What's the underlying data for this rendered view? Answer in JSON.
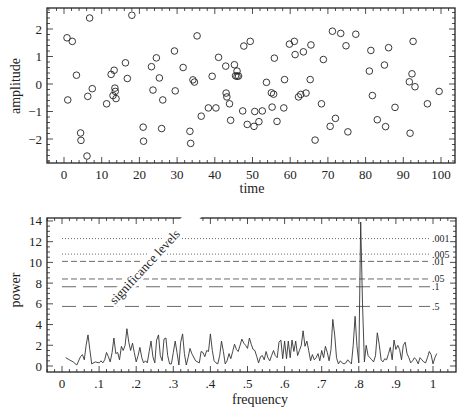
{
  "chart_data": [
    {
      "type": "scatter",
      "title": "",
      "xlabel": "time",
      "ylabel": "amplitude",
      "xlim": [
        -4,
        104
      ],
      "ylim": [
        -2.85,
        2.85
      ],
      "xticks": [
        0,
        10,
        20,
        30,
        40,
        50,
        60,
        70,
        80,
        90,
        100
      ],
      "xtick_labels": [
        "0",
        "10",
        "20",
        "30",
        "40",
        "50",
        "60",
        "70",
        "80",
        "90",
        "100"
      ],
      "yticks": [
        -2,
        -1,
        0,
        1,
        2
      ],
      "ytick_labels": [
        "−2",
        "−1",
        "0",
        "1",
        "2"
      ],
      "grid": false,
      "marker": "open-circle",
      "points": [
        [
          0.8,
          1.68
        ],
        [
          1.0,
          -0.58
        ],
        [
          2.2,
          1.55
        ],
        [
          3.3,
          0.32
        ],
        [
          4.4,
          -1.78
        ],
        [
          4.5,
          -2.05
        ],
        [
          6.1,
          -2.62
        ],
        [
          6.3,
          -0.45
        ],
        [
          6.8,
          2.4
        ],
        [
          7.5,
          -0.17
        ],
        [
          11.3,
          -0.72
        ],
        [
          12.5,
          0.35
        ],
        [
          13.0,
          -0.42
        ],
        [
          13.3,
          0.5
        ],
        [
          13.5,
          -0.15
        ],
        [
          13.6,
          -0.27
        ],
        [
          13.8,
          -0.53
        ],
        [
          16.3,
          0.77
        ],
        [
          16.8,
          0.2
        ],
        [
          18.0,
          2.5
        ],
        [
          21.0,
          -1.57
        ],
        [
          21.1,
          -2.08
        ],
        [
          23.2,
          0.63
        ],
        [
          23.6,
          -0.22
        ],
        [
          24.5,
          0.95
        ],
        [
          25.3,
          0.22
        ],
        [
          25.9,
          -1.62
        ],
        [
          26.2,
          -0.58
        ],
        [
          29.3,
          1.2
        ],
        [
          29.5,
          -0.25
        ],
        [
          31.6,
          0.6
        ],
        [
          33.4,
          -1.72
        ],
        [
          33.6,
          -2.16
        ],
        [
          34.2,
          0.15
        ],
        [
          34.6,
          0.07
        ],
        [
          35.3,
          1.75
        ],
        [
          36.4,
          -1.17
        ],
        [
          38.3,
          -0.87
        ],
        [
          39.3,
          0.28
        ],
        [
          40.3,
          -0.87
        ],
        [
          41.0,
          0.97
        ],
        [
          42.9,
          0.65
        ],
        [
          43.0,
          -0.33
        ],
        [
          43.2,
          -0.47
        ],
        [
          43.9,
          -0.72
        ],
        [
          44.2,
          -1.32
        ],
        [
          45.2,
          0.7
        ],
        [
          45.5,
          0.3
        ],
        [
          45.9,
          0.47
        ],
        [
          45.9,
          0.28
        ],
        [
          46.3,
          0.29
        ],
        [
          47.4,
          -0.98
        ],
        [
          47.7,
          1.38
        ],
        [
          48.6,
          -1.47
        ],
        [
          49.4,
          1.55
        ],
        [
          50.4,
          -1.54
        ],
        [
          50.6,
          -1.0
        ],
        [
          51.7,
          -1.37
        ],
        [
          52.6,
          -0.98
        ],
        [
          53.7,
          0.06
        ],
        [
          55.0,
          -0.32
        ],
        [
          55.2,
          -0.84
        ],
        [
          55.6,
          -0.37
        ],
        [
          55.8,
          0.94
        ],
        [
          56.5,
          -1.36
        ],
        [
          58.3,
          -0.87
        ],
        [
          58.5,
          0.16
        ],
        [
          59.8,
          1.45
        ],
        [
          61.1,
          1.55
        ],
        [
          61.3,
          1.07
        ],
        [
          62.2,
          -0.47
        ],
        [
          62.8,
          -0.38
        ],
        [
          63.5,
          1.17
        ],
        [
          64.2,
          -0.33
        ],
        [
          65.3,
          0.16
        ],
        [
          65.5,
          1.42
        ],
        [
          66.6,
          -2.04
        ],
        [
          68.3,
          -0.72
        ],
        [
          68.8,
          0.89
        ],
        [
          70.6,
          -1.54
        ],
        [
          71.2,
          1.92
        ],
        [
          72.0,
          -1.25
        ],
        [
          73.4,
          1.84
        ],
        [
          74.8,
          1.39
        ],
        [
          75.3,
          -1.74
        ],
        [
          77.4,
          1.81
        ],
        [
          81.0,
          0.47
        ],
        [
          81.4,
          1.22
        ],
        [
          81.8,
          -0.42
        ],
        [
          83.1,
          -1.3
        ],
        [
          85.0,
          0.69
        ],
        [
          85.3,
          -1.55
        ],
        [
          86.1,
          1.32
        ],
        [
          87.8,
          -0.85
        ],
        [
          91.6,
          0.08
        ],
        [
          91.8,
          -1.79
        ],
        [
          92.3,
          0.37
        ],
        [
          92.6,
          1.55
        ],
        [
          93.1,
          -0.1
        ],
        [
          96.4,
          -0.72
        ],
        [
          99.5,
          -0.27
        ]
      ]
    },
    {
      "type": "line",
      "title": "",
      "xlabel": "frequency",
      "ylabel": "power",
      "xlim": [
        -0.04,
        1.06
      ],
      "ylim": [
        -0.2,
        14.4
      ],
      "xticks": [
        0,
        0.1,
        0.2,
        0.3,
        0.4,
        0.5,
        0.6,
        0.7,
        0.8,
        0.9,
        1
      ],
      "xtick_labels": [
        "0",
        ".1",
        ".2",
        ".3",
        ".4",
        ".5",
        ".6",
        ".7",
        ".8",
        ".9",
        "1"
      ],
      "yticks": [
        0,
        2,
        4,
        6,
        8,
        10,
        12,
        14
      ],
      "ytick_labels": [
        "0",
        "2",
        "4",
        "6",
        "8",
        "10",
        "12",
        "14"
      ],
      "grid": false,
      "annotation": "significance levels",
      "significance_levels": [
        {
          "label": ".001",
          "power": 12.3,
          "style": "dotted"
        },
        {
          "label": ".005",
          "power": 10.8,
          "style": "dotted"
        },
        {
          "label": ".01",
          "power": 10.1,
          "style": "short-dash"
        },
        {
          "label": ".05",
          "power": 8.4,
          "style": "short-dash"
        },
        {
          "label": ".1",
          "power": 7.65,
          "style": "long-dash"
        },
        {
          "label": ".5",
          "power": 5.75,
          "style": "long-dash"
        }
      ],
      "series": [
        {
          "name": "power spectrum",
          "x": [
            0.01,
            0.02,
            0.03,
            0.04,
            0.05,
            0.055,
            0.06,
            0.065,
            0.07,
            0.075,
            0.08,
            0.09,
            0.1,
            0.105,
            0.11,
            0.115,
            0.12,
            0.125,
            0.13,
            0.135,
            0.14,
            0.145,
            0.15,
            0.155,
            0.16,
            0.165,
            0.17,
            0.175,
            0.18,
            0.185,
            0.19,
            0.195,
            0.2,
            0.205,
            0.21,
            0.215,
            0.22,
            0.225,
            0.23,
            0.235,
            0.24,
            0.245,
            0.25,
            0.255,
            0.26,
            0.265,
            0.27,
            0.275,
            0.28,
            0.285,
            0.29,
            0.295,
            0.3,
            0.305,
            0.31,
            0.315,
            0.32,
            0.325,
            0.33,
            0.335,
            0.34,
            0.345,
            0.35,
            0.36,
            0.37,
            0.375,
            0.38,
            0.385,
            0.39,
            0.395,
            0.4,
            0.405,
            0.41,
            0.415,
            0.42,
            0.425,
            0.43,
            0.435,
            0.44,
            0.445,
            0.45,
            0.455,
            0.46,
            0.465,
            0.47,
            0.475,
            0.48,
            0.485,
            0.49,
            0.495,
            0.5,
            0.505,
            0.51,
            0.515,
            0.52,
            0.525,
            0.53,
            0.535,
            0.54,
            0.545,
            0.55,
            0.555,
            0.56,
            0.565,
            0.57,
            0.575,
            0.58,
            0.585,
            0.59,
            0.595,
            0.6,
            0.605,
            0.61,
            0.615,
            0.62,
            0.625,
            0.63,
            0.635,
            0.64,
            0.645,
            0.65,
            0.655,
            0.66,
            0.665,
            0.67,
            0.675,
            0.68,
            0.685,
            0.69,
            0.695,
            0.7,
            0.705,
            0.71,
            0.715,
            0.72,
            0.725,
            0.73,
            0.735,
            0.74,
            0.745,
            0.75,
            0.755,
            0.76,
            0.765,
            0.77,
            0.775,
            0.78,
            0.785,
            0.79,
            0.795,
            0.8,
            0.805,
            0.81,
            0.815,
            0.82,
            0.825,
            0.83,
            0.835,
            0.84,
            0.845,
            0.85,
            0.855,
            0.86,
            0.865,
            0.87,
            0.875,
            0.88,
            0.885,
            0.89,
            0.895,
            0.9,
            0.905,
            0.91,
            0.915,
            0.92,
            0.925,
            0.93,
            0.935,
            0.94,
            0.945,
            0.95,
            0.955,
            0.96,
            0.965,
            0.97,
            0.975,
            0.98,
            0.985,
            0.99,
            0.995,
            1.0,
            1.005,
            1.01
          ],
          "y": [
            0.8,
            0.6,
            0.4,
            0.1,
            0.9,
            1.1,
            0.6,
            2.0,
            3.0,
            1.6,
            0.2,
            0.4,
            0.3,
            0.5,
            0.3,
            0.6,
            1.3,
            0.9,
            0.4,
            1.3,
            2.7,
            1.2,
            1.3,
            0.6,
            1.9,
            1.5,
            2.0,
            3.6,
            2.3,
            1.5,
            2.2,
            1.3,
            0.4,
            1.0,
            1.8,
            0.8,
            0.3,
            0.5,
            0.3,
            1.4,
            2.4,
            0.9,
            0.3,
            2.5,
            3.0,
            1.0,
            0.5,
            2.6,
            2.7,
            1.0,
            0.2,
            0.2,
            1.3,
            2.4,
            1.3,
            0.1,
            2.3,
            3.1,
            1.2,
            0.1,
            0.8,
            1.7,
            1.2,
            0.5,
            0.3,
            1.4,
            1.3,
            0.9,
            1.5,
            1.4,
            3.1,
            1.5,
            0.5,
            0.3,
            0.2,
            1.0,
            2.4,
            1.4,
            0.2,
            0.5,
            1.2,
            0.7,
            1.4,
            2.1,
            1.6,
            1.4,
            2.0,
            2.6,
            2.2,
            2.0,
            1.7,
            2.7,
            2.1,
            1.6,
            1.5,
            0.9,
            0.3,
            0.9,
            1.0,
            0.6,
            1.4,
            0.8,
            0.5,
            1.0,
            1.5,
            1.0,
            0.8,
            2.3,
            2.5,
            0.7,
            2.4,
            0.7,
            2.4,
            0.8,
            2.5,
            1.4,
            2.4,
            1.0,
            1.5,
            2.0,
            3.4,
            1.9,
            2.4,
            1.5,
            0.5,
            1.1,
            0.6,
            0.8,
            1.2,
            0.5,
            1.5,
            0.8,
            1.9,
            1.3,
            0.5,
            1.6,
            4.5,
            3.0,
            0.8,
            0.2,
            0.5,
            0.3,
            0.2,
            0.3,
            0.6,
            0.4,
            0.2,
            2.0,
            4.8,
            2.0,
            0.3,
            13.9,
            6.0,
            0.4,
            2.0,
            1.0,
            0.8,
            0.6,
            0.4,
            1.0,
            3.2,
            2.1,
            0.6,
            0.4,
            0.7,
            0.6,
            1.2,
            1.8,
            0.6,
            2.5,
            1.6,
            2.0,
            1.6,
            0.6,
            2.0,
            2.3,
            1.2,
            0.8,
            0.3,
            0.5,
            0.8,
            0.6,
            0.2,
            0.8,
            0.6,
            0.4,
            0.3,
            0.8,
            1.4,
            1.1,
            0.2,
            0.8,
            1.2,
            0.7,
            0.2
          ]
        }
      ]
    }
  ],
  "top_chart": {
    "ylabel": "amplitude",
    "xlabel": "time",
    "xtick_labels": [
      "0",
      "10",
      "20",
      "30",
      "40",
      "50",
      "60",
      "70",
      "80",
      "90",
      "100"
    ],
    "ytick_labels": [
      "−2",
      "−1",
      "0",
      "1",
      "2"
    ]
  },
  "bottom_chart": {
    "ylabel": "power",
    "xlabel": "frequency",
    "annotation": "significance levels",
    "xtick_labels": [
      "0",
      ".1",
      ".2",
      ".3",
      ".4",
      ".5",
      ".6",
      ".7",
      ".8",
      ".9",
      "1"
    ],
    "ytick_labels": [
      "0",
      "2",
      "4",
      "6",
      "8",
      "10",
      "12",
      "14"
    ],
    "level_labels": [
      ".001",
      ".005",
      ".01",
      ".05",
      ".1",
      ".5"
    ]
  },
  "colors": {
    "ink": "#222222",
    "background": "#ffffff"
  }
}
